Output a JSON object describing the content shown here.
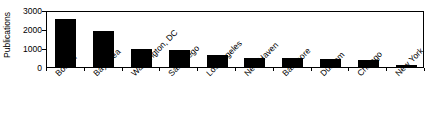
{
  "chart_data": {
    "type": "bar",
    "title": "",
    "subtitle": "",
    "xlabel": "",
    "ylabel": "Publications",
    "categories": [
      "Boston",
      "Bay Area",
      "Washington, DC",
      "San Diego",
      "Los Angeles",
      "New Haven",
      "Baltimore",
      "Durham",
      "Chicago",
      "New York"
    ],
    "values": [
      2550,
      1920,
      960,
      900,
      650,
      480,
      450,
      430,
      380,
      110
    ],
    "ylim": [
      0,
      3000
    ],
    "yticks": [
      0,
      1000,
      2000,
      3000
    ],
    "ytick_labels": [
      "0",
      "1000",
      "2000",
      "3000"
    ],
    "grid": false,
    "legend": null,
    "bar_color": "#000000",
    "axis_color": "#000000",
    "background": "#ffffff",
    "xtick_label_rotation": -45
  }
}
